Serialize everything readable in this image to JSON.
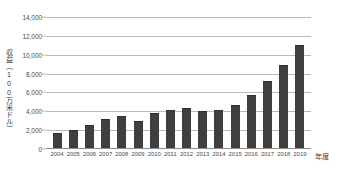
{
  "chart_data": {
    "type": "bar",
    "title": "",
    "xlabel": "年度",
    "ylabel": "収益（100万米ドル）",
    "categories": [
      "2004",
      "2005",
      "2006",
      "2007",
      "2008",
      "2009",
      "2010",
      "2011",
      "2012",
      "2013",
      "2014",
      "2015",
      "2016",
      "2017",
      "2018",
      "2019"
    ],
    "values": [
      1600,
      1900,
      2450,
      3100,
      3450,
      2850,
      3700,
      4100,
      4300,
      3950,
      4100,
      4650,
      5700,
      7150,
      8900,
      11050
    ],
    "ylim": [
      0,
      14000
    ],
    "ytick_values": [
      0,
      2000,
      4000,
      6000,
      8000,
      10000,
      12000,
      14000
    ],
    "ytick_labels": [
      "0",
      "2,000",
      "4,000",
      "6,000",
      "8,000",
      "10,000",
      "12,000",
      "14,000"
    ],
    "grid": true,
    "legend": false,
    "legend_position": "none",
    "series_color": "#3f3f3f",
    "gridline_color": "#b9b9b9",
    "background_color": "#ffffff"
  }
}
